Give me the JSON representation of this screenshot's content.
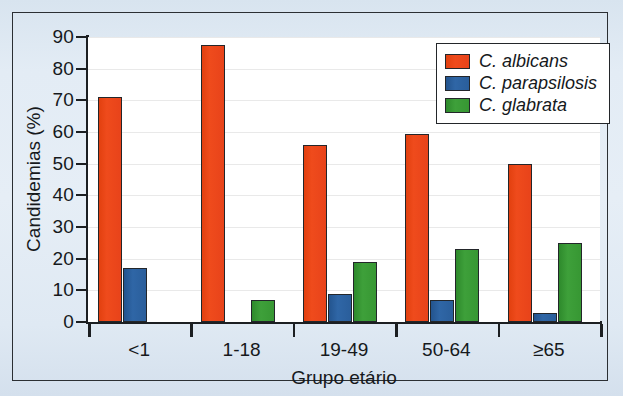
{
  "chart_data": {
    "type": "bar",
    "title": "",
    "xlabel": "Grupo etário",
    "ylabel": "Candidemias (%)",
    "categories": [
      "<1",
      "1-18",
      "19-49",
      "50-64",
      "≥65"
    ],
    "series": [
      {
        "name": "C. albicans",
        "color": "#e8431a",
        "values": [
          71,
          87.5,
          56,
          59.5,
          50
        ]
      },
      {
        "name": "C. parapsilosis",
        "color": "#2a5e9b",
        "values": [
          17,
          0,
          9,
          7,
          3
        ]
      },
      {
        "name": "C. glabrata",
        "color": "#379733",
        "values": [
          0,
          7,
          19,
          23,
          25
        ]
      }
    ],
    "ylim": [
      0,
      90
    ],
    "yticks": [
      0,
      10,
      20,
      30,
      40,
      50,
      60,
      70,
      80,
      90
    ],
    "ytick_labels": [
      "0",
      "10",
      "20",
      "30",
      "40",
      "50",
      "60",
      "70",
      "80",
      "90"
    ],
    "grid": true,
    "legend_position": "top-right"
  },
  "legend": {
    "entries": [
      {
        "label": "C. albicans"
      },
      {
        "label": "C. parapsilosis"
      },
      {
        "label": "C. glabrata"
      }
    ]
  },
  "axes": {
    "y_title": "Candidemias (%)",
    "x_title": "Grupo etário"
  },
  "colors": {
    "albicans": "#e8431a",
    "parapsilosis": "#2a5e9b",
    "glabrata": "#379733",
    "page_background": "#e3ecf5",
    "plot_background": "#ffffff",
    "axis": "#1c1f22",
    "gridline": "#e9e9e9"
  }
}
